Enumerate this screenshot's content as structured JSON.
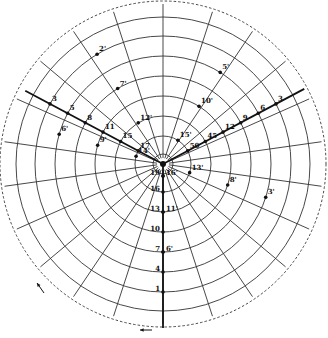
{
  "diagram": {
    "type": "polar-grid",
    "center": [
      163,
      164
    ],
    "outer_dashed_radius": 163,
    "ring_radii": [
      10,
      28,
      48,
      68,
      88,
      108,
      128,
      147
    ],
    "spoke_angles_deg": [
      -90,
      -72,
      -56,
      -40,
      -24,
      -8,
      8,
      24,
      40,
      56,
      72,
      90,
      108,
      124,
      140,
      156,
      172,
      188,
      204,
      220,
      236,
      252
    ],
    "spoke_length": 160,
    "heavy_axes": [
      {
        "name": "upper-left-axis",
        "angle_deg": 208,
        "length": 156
      },
      {
        "name": "upper-right-axis",
        "angle_deg": -28,
        "length": 160
      },
      {
        "name": "lower-vertical-axis",
        "angle_deg": 90,
        "length": 164
      }
    ],
    "series": [
      {
        "name": "upper-left-unprimed",
        "angle_deg": 208,
        "points": [
          {
            "label": "17",
            "r": 28
          },
          {
            "label": "15",
            "r": 48
          },
          {
            "label": "11",
            "r": 68
          },
          {
            "label": "8",
            "r": 88
          },
          {
            "label": "5",
            "r": 108
          },
          {
            "label": "3",
            "r": 128
          }
        ]
      },
      {
        "name": "upper-left-primed",
        "angle_deg": 239,
        "points": [
          {
            "label": "12'",
            "r": 48
          },
          {
            "label": "7'",
            "r": 88
          },
          {
            "label": "2'",
            "r": 128
          }
        ]
      },
      {
        "name": "upper-right-unprimed",
        "angle_deg": -28,
        "points": [
          {
            "label": "50",
            "r": 28
          },
          {
            "label": "45",
            "r": 48
          },
          {
            "label": "12",
            "r": 68
          },
          {
            "label": "9",
            "r": 88
          },
          {
            "label": "6",
            "r": 108
          },
          {
            "label": "3",
            "r": 128
          }
        ]
      },
      {
        "name": "upper-right-primed",
        "angle_deg": -58,
        "points": [
          {
            "label": "15'",
            "r": 28
          },
          {
            "label": "10'",
            "r": 68
          },
          {
            "label": "5'",
            "r": 108
          }
        ]
      },
      {
        "name": "lower-right-primed",
        "angle_deg": 18,
        "points": [
          {
            "label": "13'",
            "r": 28
          },
          {
            "label": "8'",
            "r": 68
          },
          {
            "label": "3'",
            "r": 108
          }
        ]
      },
      {
        "name": "lower-left-primed",
        "angle_deg": 196,
        "points": [
          {
            "label": "14'",
            "r": 28
          },
          {
            "label": "9'",
            "r": 68
          },
          {
            "label": "6'",
            "r": 108
          }
        ]
      },
      {
        "name": "lower-vertical-unprimed",
        "angle_deg": 90,
        "points": [
          {
            "label": "19",
            "r": 12
          },
          {
            "label": "16",
            "r": 28
          },
          {
            "label": "13",
            "r": 48
          },
          {
            "label": "10",
            "r": 68
          },
          {
            "label": "7",
            "r": 88
          },
          {
            "label": "4",
            "r": 108
          },
          {
            "label": "1",
            "r": 128
          }
        ]
      },
      {
        "name": "lower-vertical-primed",
        "angle_deg": 90,
        "points": [
          {
            "label": "16'",
            "r": 12
          },
          {
            "label": "11'",
            "r": 48
          },
          {
            "label": "6'",
            "r": 88
          }
        ]
      }
    ],
    "arrows": [
      {
        "name": "bottom-arrow",
        "from": [
          152,
          330
        ],
        "to": [
          140,
          330
        ]
      },
      {
        "name": "left-arrow",
        "from": [
          44,
          293
        ],
        "to": [
          37,
          283
        ]
      }
    ],
    "colors": {
      "ink": "#111111",
      "grid": "#333333",
      "background": "#ffffff"
    }
  }
}
